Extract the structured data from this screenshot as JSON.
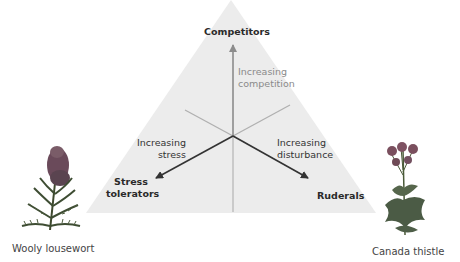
{
  "diagram": {
    "type": "CSR triangle",
    "colors": {
      "triangle_fill": "#ececec",
      "arrow_dark": "#333333",
      "arrow_gray": "#8c8c8c",
      "line_light": "#b9b9b9",
      "background": "#ffffff"
    },
    "vertices": {
      "top": {
        "label": "Competitors"
      },
      "bottom_left": {
        "label_line1": "Stress",
        "label_line2": "tolerators"
      },
      "bottom_right": {
        "label": "Ruderals"
      }
    },
    "axes": {
      "competition": {
        "line1": "Increasing",
        "line2": "competition"
      },
      "stress": {
        "line1": "Increasing",
        "line2": "stress"
      },
      "disturbance": {
        "line1": "Increasing",
        "line2": "disturbance"
      }
    },
    "examples": {
      "left": {
        "icon": "wooly-lousewort-plant-icon",
        "caption": "Wooly lousewort"
      },
      "right": {
        "icon": "canada-thistle-plant-icon",
        "caption": "Canada thistle"
      }
    }
  }
}
